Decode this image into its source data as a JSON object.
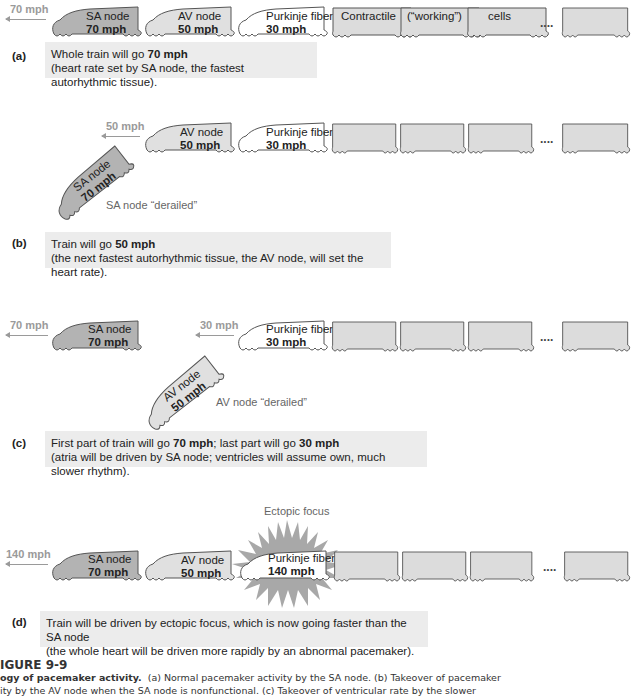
{
  "colors": {
    "sa_fill": "#b3b3b3",
    "av_fill": "#e0e0e0",
    "purkinje_fill": "#ffffff",
    "contractile_fill": "#dcdcdc",
    "outline": "#555555",
    "speed_label": "#9a9a9a",
    "caption_bg": "#ececec",
    "starburst": "#a8a8a8"
  },
  "panel_a": {
    "speed": "70 mph",
    "cars": [
      {
        "name": "SA node",
        "speed": "70 mph"
      },
      {
        "name": "AV node",
        "speed": "50 mph"
      },
      {
        "name": "Purkinje fiber",
        "speed": "30 mph"
      },
      {
        "name": "Contractile"
      },
      {
        "name": "(“working”)"
      },
      {
        "name": "cells"
      },
      {
        "name": ""
      }
    ],
    "ellipsis": "....",
    "tag": "(a)",
    "caption_line1_pre": "Whole train will go ",
    "caption_line1_bold": "70 mph",
    "caption_line2": "(heart rate set by SA node, the fastest autorhythmic tissue)."
  },
  "panel_b": {
    "speed": "50 mph",
    "cars": [
      {
        "name": "AV node",
        "speed": "50 mph"
      },
      {
        "name": "Purkinje fiber",
        "speed": "30 mph"
      }
    ],
    "derailed_car": {
      "name": "SA node",
      "speed": "70 mph"
    },
    "derailed_note": "SA node “derailed”",
    "ellipsis": "....",
    "tag": "(b)",
    "caption_line1_pre": "Train will go ",
    "caption_line1_bold": "50 mph",
    "caption_line2": "(the next fastest autorhythmic tissue, the AV node, will set the heart rate)."
  },
  "panel_c": {
    "front_speed": "70 mph",
    "rear_speed": "30 mph",
    "front_car": {
      "name": "SA node",
      "speed": "70 mph"
    },
    "rear_car": {
      "name": "Purkinje fiber",
      "speed": "30 mph"
    },
    "derailed_car": {
      "name": "AV node",
      "speed": "50 mph"
    },
    "derailed_note": "AV node “derailed”",
    "ellipsis": "....",
    "tag": "(c)",
    "caption_line1_pre": "First part of train will go ",
    "caption_line1_bold1": "70 mph",
    "caption_line1_mid": "; last part will go ",
    "caption_line1_bold2": "30 mph",
    "caption_line2": "(atria will be driven by SA node; ventricles will assume own, much slower rhythm)."
  },
  "panel_d": {
    "speed": "140 mph",
    "ectopic_label": "Ectopic focus",
    "cars": [
      {
        "name": "SA node",
        "speed": "70 mph"
      },
      {
        "name": "AV node",
        "speed": "50 mph"
      },
      {
        "name": "Purkinje fiber",
        "speed": "140 mph"
      }
    ],
    "ellipsis": "....",
    "tag": "(d)",
    "caption_line1": "Train will be driven by ectopic focus, which is now going faster than the SA node",
    "caption_line2": "(the whole heart will be driven more rapidly by an abnormal pacemaker)."
  },
  "figure": {
    "title": "IGURE 9-9",
    "line1_bold": "ogy of pacemaker activity.",
    "line1_rest": "  (a) Normal pacemaker activity by the SA node. (b) Takeover of pacemaker",
    "line2": "ity by the AV node when the SA node is nonfunctional. (c) Takeover of ventricular rate by the slower"
  }
}
